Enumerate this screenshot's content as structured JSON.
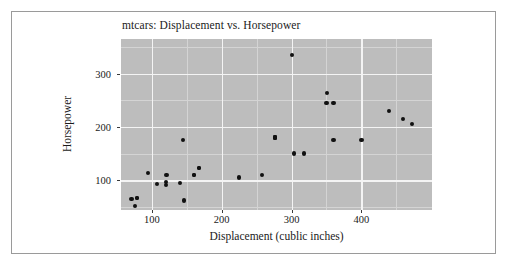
{
  "figure": {
    "background_color": "#ffffff",
    "border_color": "#9a9a9a",
    "panel_color": "#bdbdbd",
    "gridline_color": "#f4f4f4",
    "point_color": "#111111"
  },
  "chart_data": {
    "type": "scatter",
    "title": "mtcars: Displacement vs. Horsepower",
    "xlabel": "Displacement (cublic inches)",
    "ylabel": "Horsepower",
    "xlim": [
      56,
      501
    ],
    "ylim": [
      44,
      365
    ],
    "xticks": [
      100,
      200,
      300,
      400
    ],
    "yticks": [
      100,
      200,
      300
    ],
    "xtick_labels": [
      "100",
      "200",
      "300",
      "400"
    ],
    "ytick_labels": [
      "100",
      "200",
      "300"
    ],
    "grid": true,
    "legend": null,
    "series": [
      {
        "name": "mtcars",
        "marker": "circle",
        "color": "#111111",
        "points": [
          {
            "x": 160.0,
            "y": 110
          },
          {
            "x": 160.0,
            "y": 110
          },
          {
            "x": 108.0,
            "y": 93
          },
          {
            "x": 258.0,
            "y": 110
          },
          {
            "x": 360.0,
            "y": 175
          },
          {
            "x": 225.0,
            "y": 105
          },
          {
            "x": 360.0,
            "y": 245
          },
          {
            "x": 146.7,
            "y": 62
          },
          {
            "x": 140.8,
            "y": 95
          },
          {
            "x": 167.6,
            "y": 123
          },
          {
            "x": 167.6,
            "y": 123
          },
          {
            "x": 275.8,
            "y": 180
          },
          {
            "x": 275.8,
            "y": 180
          },
          {
            "x": 275.8,
            "y": 180
          },
          {
            "x": 472.0,
            "y": 205
          },
          {
            "x": 460.0,
            "y": 215
          },
          {
            "x": 440.0,
            "y": 230
          },
          {
            "x": 78.7,
            "y": 66
          },
          {
            "x": 75.7,
            "y": 52
          },
          {
            "x": 71.1,
            "y": 65
          },
          {
            "x": 120.1,
            "y": 97
          },
          {
            "x": 318.0,
            "y": 150
          },
          {
            "x": 304.0,
            "y": 150
          },
          {
            "x": 350.0,
            "y": 245
          },
          {
            "x": 400.0,
            "y": 175
          },
          {
            "x": 79.0,
            "y": 66
          },
          {
            "x": 120.3,
            "y": 91
          },
          {
            "x": 95.1,
            "y": 113
          },
          {
            "x": 351.0,
            "y": 264
          },
          {
            "x": 145.0,
            "y": 175
          },
          {
            "x": 301.0,
            "y": 335
          },
          {
            "x": 121.0,
            "y": 109
          }
        ]
      }
    ]
  }
}
